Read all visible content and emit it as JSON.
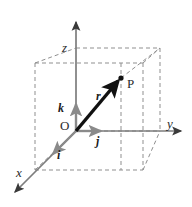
{
  "figure": {
    "background_color": "#ffffff",
    "width": 192,
    "height": 207
  },
  "colors": {
    "axis": "#7d7d7d",
    "axis_dark": "#3a3a3a",
    "vector": "#111111",
    "unit_vector": "#8a8a8a",
    "dashed_box": "#8f8f8f",
    "label": "#2b2b2b"
  },
  "axes": [
    {
      "name": "z-axis",
      "label": "z",
      "direction": "up",
      "label_x": 62,
      "label_y": 52,
      "line": {
        "x1": 76,
        "y1": 131,
        "x2": 76,
        "y2": 20
      },
      "arrow": "up"
    },
    {
      "name": "y-axis",
      "label": "y",
      "direction": "right",
      "label_x": 167,
      "label_y": 128,
      "line": {
        "x1": 76,
        "y1": 131,
        "x2": 184,
        "y2": 131
      },
      "arrow": "right"
    },
    {
      "name": "x-axis",
      "label": "x",
      "direction": "down-left",
      "label_x": 16,
      "label_y": 177,
      "line": {
        "x1": 76,
        "y1": 131,
        "x2": 12,
        "y2": 196
      },
      "arrow": "down-left"
    }
  ],
  "unit_vectors": [
    {
      "name": "i",
      "label": "i",
      "label_x": 57,
      "label_y": 159,
      "line": {
        "x1": 76,
        "y1": 131,
        "x2": 50,
        "y2": 157
      },
      "color": "#8a8a8a"
    },
    {
      "name": "j",
      "label": "j",
      "label_x": 96,
      "label_y": 145,
      "line": {
        "x1": 76,
        "y1": 131,
        "x2": 104,
        "y2": 131
      },
      "color": "#8a8a8a"
    },
    {
      "name": "k",
      "label": "k",
      "label_x": 58,
      "label_y": 112,
      "line": {
        "x1": 76,
        "y1": 131,
        "x2": 76,
        "y2": 101
      },
      "color": "#8a8a8a"
    }
  ],
  "position_vector": {
    "name": "r",
    "label": "r",
    "label_x": 96,
    "label_y": 100,
    "line": {
      "x1": 76,
      "y1": 131,
      "x2": 121,
      "y2": 78
    },
    "color": "#111111"
  },
  "points": [
    {
      "name": "P",
      "label": "P",
      "x": 121,
      "y": 78,
      "label_x": 127,
      "label_y": 88,
      "dot_radius": 2.6
    },
    {
      "name": "O",
      "label": "O",
      "x": 76,
      "y": 131,
      "label_x": 60,
      "label_y": 130
    }
  ],
  "dashed_box": {
    "stroke": "#8f8f8f",
    "dash_pattern": "4,3",
    "front_bottom_left": {
      "x": 35,
      "y": 170
    },
    "front_bottom_right": {
      "x": 143,
      "y": 170
    },
    "front_top_left": {
      "x": 35,
      "y": 63
    },
    "front_top_right": {
      "x": 143,
      "y": 63
    },
    "back_bottom_left": {
      "x": 76,
      "y": 131
    },
    "back_bottom_right": {
      "x": 160,
      "y": 131
    },
    "back_top_left": {
      "x": 76,
      "y": 48
    },
    "back_top_right": {
      "x": 160,
      "y": 48
    }
  }
}
